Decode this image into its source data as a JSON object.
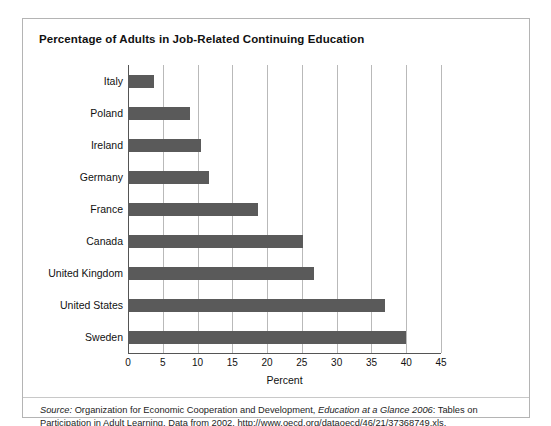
{
  "figure": {
    "title": "Percentage of Adults in Job-Related Continuing Education",
    "xaxis_title": "Percent",
    "source": {
      "label": "Source:",
      "part1": " Organization for Economic Cooperation and Development, ",
      "work": "Education at a Glance 2006",
      "part2": ": Tables on Participation in Adult Learning. Data from 2002. http://www.oecd.org/dataoecd/46/21/37368749.xls."
    },
    "colors": {
      "bar": "#5a5a5a",
      "grid": "#b9b9b9",
      "axis": "#555555",
      "frame": "#b4b4b4",
      "background": "#ffffff",
      "text": "#111111"
    }
  },
  "chart_data": {
    "type": "bar",
    "orientation": "horizontal",
    "title": "Percentage of Adults in Job-Related Continuing Education",
    "xlabel": "Percent",
    "ylabel": "",
    "xlim": [
      0,
      45
    ],
    "xticks": [
      0,
      5,
      10,
      15,
      20,
      25,
      30,
      35,
      40,
      45
    ],
    "grid": "vertical",
    "legend": "none",
    "categories": [
      "Italy",
      "Poland",
      "Ireland",
      "Germany",
      "France",
      "Canada",
      "United Kingdom",
      "United States",
      "Sweden"
    ],
    "values": [
      3.8,
      8.9,
      10.5,
      11.7,
      18.7,
      25.2,
      26.8,
      37.0,
      40.0
    ]
  }
}
